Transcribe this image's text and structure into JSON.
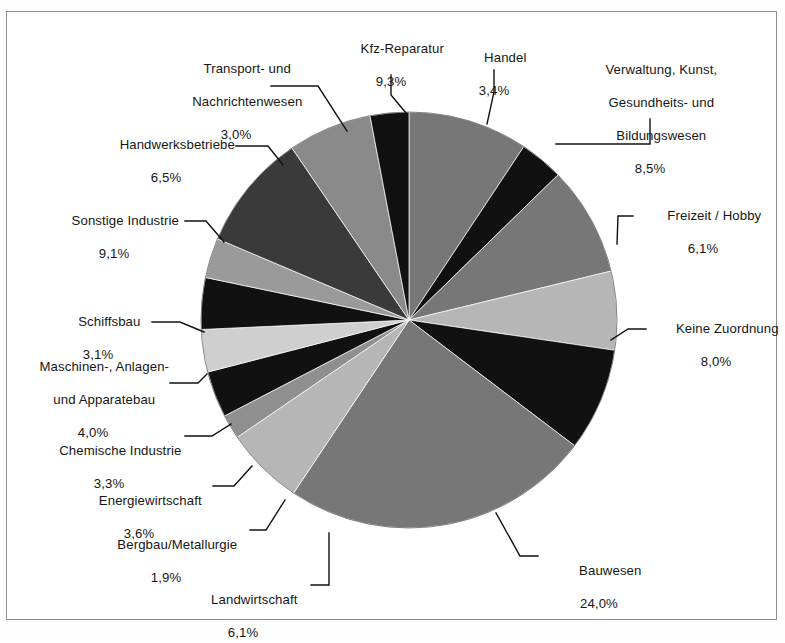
{
  "figure": {
    "kind": "pie-chart",
    "background": "#ffffff",
    "border_color": "#8d8d8d",
    "center_x": 409,
    "center_y": 320,
    "radius": 208
  },
  "chart_data": {
    "type": "pie",
    "title": "",
    "xlabel": "",
    "ylabel": "",
    "units": "percent",
    "decimal_separator": ",",
    "start_angle_deg": 0,
    "direction": "clockwise",
    "legend": "none (direct labels with leader lines)",
    "labels": [
      "Kfz-Reparatur",
      "Handel",
      "Verwaltung, Kunst,\nGesundheits- und\nBildungswesen",
      "Freizeit / Hobby",
      "Keine Zuordnung",
      "Bauwesen",
      "Landwirtschaft",
      "Bergbau/Metallurgie",
      "Energiewirtschaft",
      "Chemische Industrie",
      "Maschinen-, Anlagen-\nund Apparatebau",
      "Schiffsbau",
      "Sonstige Industrie",
      "Handwerksbetriebe",
      "Transport- und\nNachrichtenwesen"
    ],
    "values": [
      9.3,
      3.4,
      8.5,
      6.1,
      8.0,
      24.0,
      6.1,
      1.9,
      3.6,
      3.3,
      4.0,
      3.1,
      9.1,
      6.5,
      3.0
    ],
    "value_labels": [
      "9,3%",
      "3,4%",
      "8,5%",
      "6,1%",
      "8,0%",
      "24,0%",
      "6,1%",
      "1,9%",
      "3,6%",
      "3,3%",
      "4,0%",
      "3,1%",
      "9,1%",
      "6,5%",
      "3,0%"
    ],
    "colors": [
      "#777777",
      "#111111",
      "#777777",
      "#b6b6b6",
      "#111111",
      "#777777",
      "#b6b6b6",
      "#8f8f8f",
      "#111111",
      "#cfcfcf",
      "#111111",
      "#9a9a9a",
      "#3a3a3a",
      "#8a8a8a",
      "#111111"
    ],
    "slices": [
      {
        "name": "Kfz-Reparatur",
        "value": 9.3,
        "value_label": "9,3%",
        "color": "#777777"
      },
      {
        "name": "Handel",
        "value": 3.4,
        "value_label": "3,4%",
        "color": "#111111"
      },
      {
        "name": "Verwaltung, Kunst, Gesundheits- und Bildungswesen",
        "value": 8.5,
        "value_label": "8,5%",
        "color": "#777777"
      },
      {
        "name": "Freizeit / Hobby",
        "value": 6.1,
        "value_label": "6,1%",
        "color": "#b6b6b6"
      },
      {
        "name": "Keine Zuordnung",
        "value": 8.0,
        "value_label": "8,0%",
        "color": "#111111"
      },
      {
        "name": "Bauwesen",
        "value": 24.0,
        "value_label": "24,0%",
        "color": "#777777"
      },
      {
        "name": "Landwirtschaft",
        "value": 6.1,
        "value_label": "6,1%",
        "color": "#b6b6b6"
      },
      {
        "name": "Bergbau/Metallurgie",
        "value": 1.9,
        "value_label": "1,9%",
        "color": "#8f8f8f"
      },
      {
        "name": "Energiewirtschaft",
        "value": 3.6,
        "value_label": "3,6%",
        "color": "#111111"
      },
      {
        "name": "Chemische Industrie",
        "value": 3.3,
        "value_label": "3,3%",
        "color": "#cfcfcf"
      },
      {
        "name": "Maschinen-, Anlagen- und Apparatebau",
        "value": 4.0,
        "value_label": "4,0%",
        "color": "#111111"
      },
      {
        "name": "Schiffsbau",
        "value": 3.1,
        "value_label": "3,1%",
        "color": "#9a9a9a"
      },
      {
        "name": "Sonstige Industrie",
        "value": 9.1,
        "value_label": "9,1%",
        "color": "#3a3a3a"
      },
      {
        "name": "Handwerksbetriebe",
        "value": 6.5,
        "value_label": "6,5%",
        "color": "#8a8a8a"
      },
      {
        "name": "Transport- und Nachrichtenwesen",
        "value": 3.0,
        "value_label": "3,0%",
        "color": "#111111"
      }
    ],
    "total": 100.0
  },
  "annotations": {
    "kfz": {
      "line1": "Kfz-Reparatur",
      "pct": "9,3%"
    },
    "handel": {
      "line1": "Handel",
      "pct": "3,4%"
    },
    "verwaltung": {
      "line1": "Verwaltung, Kunst,",
      "line2": "Gesundheits- und",
      "line3": "Bildungswesen",
      "pct": "8,5%"
    },
    "freizeit": {
      "line1": "Freizeit / Hobby",
      "pct": "6,1%"
    },
    "keine": {
      "line1": "Keine Zuordnung",
      "pct": "8,0%"
    },
    "bauwesen": {
      "line1": "Bauwesen",
      "pct": "24,0%"
    },
    "landwirt": {
      "line1": "Landwirtschaft",
      "pct": "6,1%"
    },
    "bergbau": {
      "line1": "Bergbau/Metallurgie",
      "pct": "1,9%"
    },
    "energie": {
      "line1": "Energiewirtschaft",
      "pct": "3,6%"
    },
    "chemie": {
      "line1": "Chemische Industrie",
      "pct": "3,3%"
    },
    "maschinen": {
      "line1": "Maschinen-, Anlagen-",
      "line2": "und Apparatebau",
      "pct": "4,0%"
    },
    "schiffsbau": {
      "line1": "Schiffsbau",
      "pct": "3,1%"
    },
    "sonstige": {
      "line1": "Sonstige Industrie",
      "pct": "9,1%"
    },
    "handwerk": {
      "line1": "Handwerksbetriebe",
      "pct": "6,5%"
    },
    "transport": {
      "line1": "Transport- und",
      "line2": "Nachrichtenwesen",
      "pct": "3,0%"
    }
  }
}
